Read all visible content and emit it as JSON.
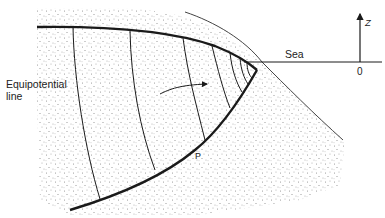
{
  "figure": {
    "labels": {
      "equipotential_line_1": "Equipotential",
      "equipotential_line_2": "line",
      "sea": "Sea",
      "interface": "P",
      "axis_z": "Z",
      "origin": "0"
    },
    "colors": {
      "ink": "#1a1a1a",
      "stipple": "#8a8a8a",
      "background": "#ffffff"
    },
    "elements": [
      "land-surface-line",
      "water-table-boundary",
      "saltwater-interface-P",
      "equipotential-lines",
      "flow-arrow",
      "sea-level-line",
      "z-axis-arrow"
    ]
  }
}
